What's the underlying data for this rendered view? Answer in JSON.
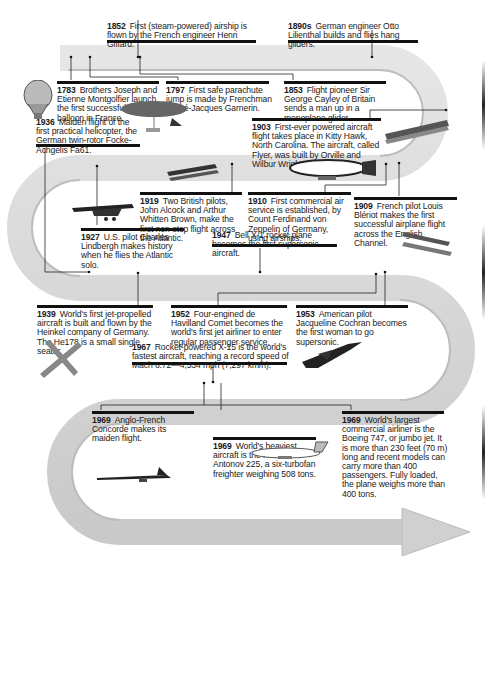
{
  "events": [
    {
      "year": "1852",
      "text": "First (steam-powered) airship is flown by the French engineer Henri Giffard."
    },
    {
      "year": "1890s",
      "text": "German engineer Otto Lilienthal builds and flies hang gliders."
    },
    {
      "year": "1783",
      "text": "Brothers Joseph and Etienne Montgolfier launch the first successful hot air balloon in France."
    },
    {
      "year": "1797",
      "text": "First safe parachute jump is made by Frenchman André-Jacques Garnerin."
    },
    {
      "year": "1853",
      "text": "Flight pioneer Sir George Cayley of Britain sends a man up in a monoplane glider."
    },
    {
      "year": "1936",
      "text": "Maiden flight of the first practical helicopter, the German twin-rotor Focke-Achgelis Fa61."
    },
    {
      "year": "1903",
      "text": "First-ever powered aircraft flight takes place in Kitty Hawk, North Carolina. The aircraft, called Flyer, was built by Orville and Wilbur Wright."
    },
    {
      "year": "1919",
      "text": "Two British pilots, John Alcock and Arthur Whitten Brown, make the first non-stop flight across the Atlantic."
    },
    {
      "year": "1910",
      "text": "First commercial air service is established, by Count Ferdinand von Zeppelin of Germany, using airships."
    },
    {
      "year": "1909",
      "text": "French pilot Louis Blériot makes the first successful airplane flight across the English Channel."
    },
    {
      "year": "1927",
      "text": "U.S. pilot Charles Lindbergh makes history when he flies the Atlantic solo."
    },
    {
      "year": "1947",
      "text": "Bell X-1 rocket plane becomes the first supersonic aircraft."
    },
    {
      "year": "1939",
      "text": "World's first jet-propelled aircraft is built and flown by the Heinkel company of Germany. The He178 is a small single seater."
    },
    {
      "year": "1952",
      "text": "Four-engined de Havilland Comet becomes the world's first jet airliner to enter regular passenger service."
    },
    {
      "year": "1953",
      "text": "American pilot Jacqueline Cochran becomes the first woman to go supersonic."
    },
    {
      "year": "1967",
      "text": "Rocket-powered X-15 is the world's fastest aircraft, reaching a record speed of Mach 6.72—4,534 mph (7,297 km/h)."
    },
    {
      "year": "1969",
      "text": "Anglo-French Concorde makes its maiden flight."
    },
    {
      "year": "1969",
      "text": "World's heaviest aircraft is the Russian Antonov 225, a six-turbofan freighter weighing 508 tons."
    },
    {
      "year": "1969",
      "text": "World's largest commercial airliner is the Boeing 747, or jumbo jet. It is more than 230 feet (70 m) long and recent models can carry more than 400 passengers. Fully loaded, the plane weighs more than 400 tons."
    }
  ],
  "illustrations": [
    "hot-air-balloon",
    "airship-giffard",
    "wright-flyer",
    "zeppelin",
    "vimy-biplane",
    "spirit-of-st-louis",
    "bleriot-monoplane",
    "heinkel-jet",
    "x15-rocket-plane",
    "concorde",
    "boeing-747"
  ],
  "colors": {
    "ribbon": "#d3d3d3",
    "ribbon_edge": "#bdbdbd",
    "text": "#1a1a1a",
    "rule": "#111111"
  }
}
